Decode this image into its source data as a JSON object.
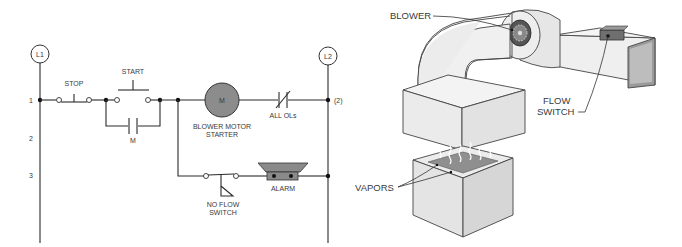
{
  "ladder": {
    "rails": {
      "left": "L1",
      "right": "L2"
    },
    "rung_numbers": [
      "1",
      "2",
      "3"
    ],
    "right_ref": "(2)",
    "components": {
      "stop": "STOP",
      "start": "START",
      "seal_in": "M",
      "motor_coil": "M",
      "motor_label_line1": "BLOWER MOTOR",
      "motor_label_line2": "STARTER",
      "overloads": "ALL OLs",
      "alarm": "ALARM",
      "flow_switch_line1": "NO FLOW",
      "flow_switch_line2": "SWITCH"
    }
  },
  "illustration": {
    "blower": "BLOWER",
    "flow_switch_line1": "FLOW",
    "flow_switch_line2": "SWITCH",
    "vapors": "VAPORS"
  },
  "colors": {
    "coil_fill": "#8c8c8c",
    "alarm_fill": "#8a8a8a",
    "duct_light": "#efefef",
    "duct_mid": "#dcdcdc",
    "duct_dark": "#9a9a9a",
    "vapor_tank_top": "#8f8f8f"
  }
}
